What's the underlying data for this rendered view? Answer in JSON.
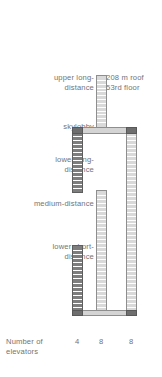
{
  "diagram": {
    "title_note": "Elevator shaft arrangement of a high-rise building",
    "labels": {
      "upper_long": "upper long-\ndistance",
      "skylobby": "skylobby",
      "lower_long": "lower long-\ndistance",
      "medium": "medium-distance",
      "lower_short": "lower short-\ndistance",
      "roof": "208 m roof\n53rd floor",
      "number_of_elevators": "Number of\nelevators"
    },
    "elevator_counts": [
      "4",
      "8",
      "8"
    ],
    "colors": {
      "dark_shaft": "#7e7e7e",
      "light_shaft": "#d9d9d9",
      "outline": "#8e8e8e",
      "cap": "#6e6e6e",
      "text": "#737373",
      "background": "#ffffff"
    },
    "shafts": [
      {
        "name": "upper-long-distance",
        "column": 1,
        "style": "light",
        "top": 75,
        "bottom": 127,
        "rungs": 13
      },
      {
        "name": "lower-long-distance",
        "column": 0,
        "style": "dark",
        "top": 127,
        "bottom": 193,
        "rungs": 16
      },
      {
        "name": "medium-distance",
        "column": 1,
        "style": "light",
        "top": 190,
        "bottom": 316,
        "rungs": 31
      },
      {
        "name": "lower-short-distance",
        "column": 0,
        "style": "dark",
        "top": 245,
        "bottom": 316,
        "rungs": 17
      },
      {
        "name": "right-full-height",
        "column": 2,
        "style": "light",
        "top": 127,
        "bottom": 316,
        "rungs": 47
      }
    ]
  }
}
